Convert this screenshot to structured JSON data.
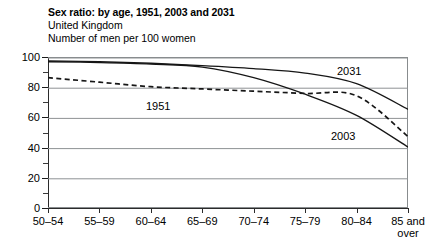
{
  "heading": {
    "title": "Sex ratio: by age, 1951, 2003 and 2031",
    "subtitle": "United Kingdom",
    "units": "Number of men per 100 women"
  },
  "chart_data": {
    "type": "line",
    "title": "Sex ratio: by age, 1951, 2003 and 2031",
    "subtitle": "United Kingdom",
    "ylabel": "Number of men per 100 women",
    "xlabel": "",
    "categories": [
      "50–54",
      "55–59",
      "60–64",
      "65–69",
      "70–74",
      "75–79",
      "80–84",
      "85 and over"
    ],
    "category_lines": [
      [
        "50–54"
      ],
      [
        "55–59"
      ],
      [
        "60–64"
      ],
      [
        "65–69"
      ],
      [
        "70–74"
      ],
      [
        "75–79"
      ],
      [
        "80–84"
      ],
      [
        "85 and",
        "over"
      ]
    ],
    "ylim": [
      0,
      100
    ],
    "yticks": [
      0,
      20,
      40,
      60,
      80,
      100
    ],
    "yticklabels": [
      "0",
      "20",
      "40",
      "60",
      "80",
      "100"
    ],
    "yminorticks": [
      10,
      30,
      50,
      70,
      90
    ],
    "grid": "horizontal",
    "grid_color": "#8e9294",
    "legend": "inline-annotations",
    "series": [
      {
        "name": "1951",
        "style": "dashed",
        "color": "#161616",
        "label_x_category": "65–69",
        "values": [
          87,
          84,
          81,
          79.5,
          78,
          76.5,
          75,
          48
        ]
      },
      {
        "name": "2003",
        "style": "solid",
        "color": "#161616",
        "label_x_category": "80–84",
        "values": [
          97.5,
          97,
          96,
          94,
          87,
          76,
          62,
          41
        ]
      },
      {
        "name": "2031",
        "style": "solid",
        "color": "#161616",
        "label_x_category": "80–84",
        "values": [
          98,
          97.5,
          96.5,
          95,
          93,
          90,
          83,
          66
        ]
      }
    ],
    "annotations": [
      {
        "text": "1951",
        "x_px": 146,
        "y_px": 101
      },
      {
        "text": "2003",
        "x_px": 331,
        "y_px": 131
      },
      {
        "text": "2031",
        "x_px": 337,
        "y_px": 66
      }
    ]
  }
}
